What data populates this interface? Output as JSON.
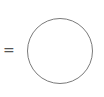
{
  "operator": {
    "symbol": "="
  },
  "shape": {
    "type": "circle",
    "stroke_color": "#7a7a7a",
    "fill_color": "#ffffff"
  }
}
